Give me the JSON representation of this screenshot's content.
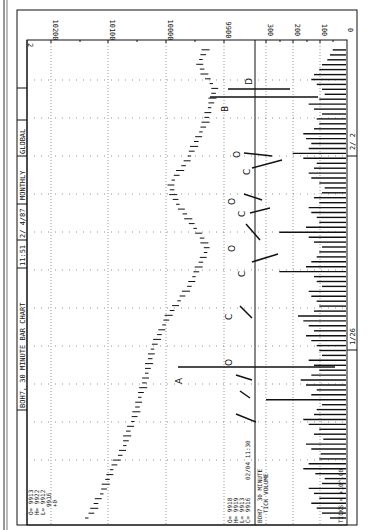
{
  "header": {
    "title": "BOH7, 30 MINUTE BAR CHART",
    "time": "11:51",
    "date": "2/ 4/87",
    "period": "MONTHLY",
    "scope": "GLOBAL",
    "page": "2"
  },
  "ohlc_top": {
    "O": "O= 9913",
    "H": "H= 9922",
    "L": "L= 9912",
    "C": "9916",
    "change": "+0"
  },
  "ohlc_bottom": {
    "O": "O= 9918",
    "H": "H= 9919",
    "L": "L= 9913",
    "C": "C= 9916",
    "stamp": "02/04  11:30"
  },
  "volume_panel": {
    "title_line1": "BOH7, 30 MINUTE",
    "title_line2": "TICK VOLUME",
    "footer": "TICKS = +10^.00"
  },
  "annotations": [
    "A",
    "B",
    "D",
    "C",
    "O",
    "C",
    "O",
    "C",
    "O",
    "C",
    "O"
  ],
  "chart_data": [
    {
      "type": "bar",
      "title": "BOH7, 30 MINUTE BAR CHART",
      "subtitle": "11:51  2/ 4/87  MONTHLY  GLOBAL",
      "orientation": "rotated 90 degrees clockwise (time runs bottom-to-top, price increases leftward)",
      "xlabel": "",
      "ylabel": "",
      "x_tick_labels": [
        "1/26",
        "2/ 2"
      ],
      "y_tick_labels": [
        "10200",
        "10100",
        "10000",
        "9900"
      ],
      "ylim": [
        9880,
        10240
      ],
      "grid": true,
      "series": [
        {
          "name": "OHLC bars (approx. midpoints, chronological)",
          "values": [
            10138,
            10130,
            10125,
            10122,
            10118,
            10112,
            10108,
            10105,
            10102,
            10098,
            10095,
            10090,
            10086,
            10080,
            10076,
            10072,
            10070,
            10068,
            10066,
            10062,
            10058,
            10055,
            10052,
            10050,
            10048,
            10046,
            10044,
            10040,
            10038,
            10036,
            10034,
            10032,
            10030,
            10028,
            10026,
            10024,
            10020,
            10016,
            10012,
            10008,
            10004,
            10000,
            9996,
            9990,
            9984,
            9978,
            9972,
            9966,
            9960,
            9956,
            9952,
            9948,
            9944,
            9940,
            9936,
            9932,
            9930,
            9934,
            9938,
            9944,
            9950,
            9956,
            9962,
            9968,
            9974,
            9980,
            9984,
            9988,
            9990,
            9992,
            9988,
            9982,
            9976,
            9970,
            9964,
            9960,
            9956,
            9952,
            9948,
            9944,
            9940,
            9936,
            9932,
            9930,
            9928,
            9925,
            9922,
            9920,
            9918,
            9916,
            9922,
            9928,
            9934,
            9938,
            9942,
            9940,
            9936,
            9932
          ]
        }
      ],
      "annotations": [
        {
          "label": "A",
          "note": "long reference line across price and volume panels near 1/29"
        },
        {
          "label": "B",
          "note": "reference line near 2/3"
        },
        {
          "label": "D",
          "note": "reference line near 2/3"
        },
        {
          "label": "C/O",
          "note": "pairs of slanted lines marking close/open gaps between sessions"
        }
      ]
    },
    {
      "type": "bar",
      "title": "BOH7, 30 MINUTE TICK VOLUME",
      "xlabel": "",
      "ylabel": "TICKS = +10^.00",
      "y_tick_labels": [
        "300",
        "200",
        "100",
        "0"
      ],
      "ylim": [
        0,
        340
      ],
      "grid": true,
      "series": [
        {
          "name": "Tick volume",
          "values": [
            60,
            90,
            110,
            130,
            100,
            120,
            140,
            90,
            80,
            115,
            160,
            140,
            100,
            95,
            130,
            150,
            85,
            120,
            100,
            140,
            160,
            120,
            110,
            90,
            300,
            130,
            110,
            150,
            170,
            130,
            100,
            120,
            140,
            90,
            100,
            110,
            130,
            150,
            120,
            140,
            160,
            180,
            120,
            100,
            110,
            130,
            140,
            90,
            110,
            120,
            250,
            150,
            130,
            110,
            100,
            90,
            120,
            140,
            250,
            150,
            100,
            110,
            130,
            140,
            100,
            120,
            90,
            80,
            100,
            130,
            140,
            120,
            110,
            160,
            200,
            140,
            130,
            150,
            160,
            120,
            100,
            110,
            90,
            120,
            140,
            100,
            80,
            90,
            110,
            130,
            120,
            100,
            90,
            70,
            60,
            50
          ]
        }
      ]
    }
  ]
}
